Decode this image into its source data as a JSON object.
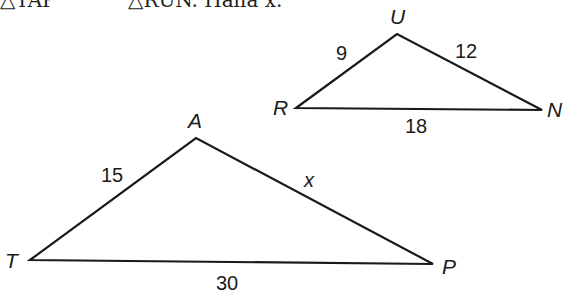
{
  "problem": {
    "statement_part1": "△TAP",
    "statement_part2": "△RUN. Halla x.",
    "similarity_symbol": "~"
  },
  "triangles": [
    {
      "name": "RUN",
      "vertices": [
        {
          "label": "R",
          "x": 296,
          "y": 108
        },
        {
          "label": "U",
          "x": 397,
          "y": 34
        },
        {
          "label": "N",
          "x": 542,
          "y": 110
        }
      ],
      "sides": [
        {
          "between": "RU",
          "label": "9"
        },
        {
          "between": "UN",
          "label": "12"
        },
        {
          "between": "RN",
          "label": "18"
        }
      ]
    },
    {
      "name": "TAP",
      "vertices": [
        {
          "label": "T",
          "x": 30,
          "y": 260
        },
        {
          "label": "A",
          "x": 196,
          "y": 138
        },
        {
          "label": "P",
          "x": 433,
          "y": 264
        }
      ],
      "sides": [
        {
          "between": "TA",
          "label": "15"
        },
        {
          "between": "AP",
          "label": "x"
        },
        {
          "between": "TP",
          "label": "30"
        }
      ]
    }
  ]
}
